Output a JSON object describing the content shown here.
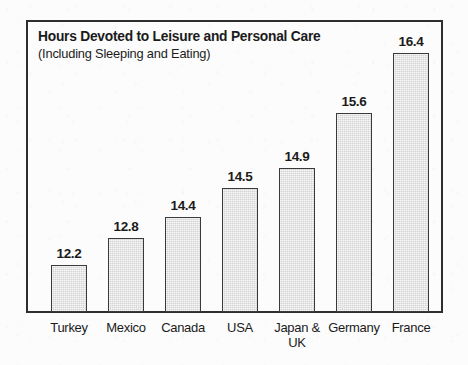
{
  "chart": {
    "title": "Hours Devoted to Leisure and Personal Care",
    "subtitle": "(Including Sleeping and Eating)"
  },
  "chart_data": {
    "type": "bar",
    "title": "Hours Devoted to Leisure and Personal Care",
    "subtitle": "(Including Sleeping and Eating)",
    "xlabel": "",
    "ylabel": "",
    "ylim": [
      0,
      17.6
    ],
    "grid": false,
    "legend": false,
    "value_labels": true,
    "bar_fill_color": "#d4d4d4",
    "bar_border_color": "#3a3a3a",
    "frame_color": "#2e2e2e",
    "background_color": "#fcfcfc",
    "categories": [
      "Turkey",
      "Mexico",
      "Canada",
      "USA",
      "Japan & UK",
      "Germany",
      "France"
    ],
    "category_lines": [
      [
        "Turkey"
      ],
      [
        "Mexico"
      ],
      [
        "Canada"
      ],
      [
        "USA"
      ],
      [
        "Japan &",
        "UK"
      ],
      [
        "Germany"
      ],
      [
        "France"
      ]
    ],
    "values": [
      12.2,
      12.8,
      14.4,
      14.5,
      14.9,
      15.6,
      16.4
    ],
    "value_labels_text": [
      "12.2",
      "12.8",
      "14.4",
      "14.5",
      "14.9",
      "15.6",
      "16.4"
    ],
    "series": [
      {
        "name": "Hours per day",
        "values": [
          12.2,
          12.8,
          14.4,
          14.5,
          14.9,
          15.6,
          16.4
        ]
      }
    ],
    "units": "hours per day"
  },
  "bars": [
    {
      "label": "Turkey",
      "line2": "",
      "value": "12.2",
      "x": 51,
      "width": 36,
      "top": 265
    },
    {
      "label": "Mexico",
      "line2": "",
      "value": "12.8",
      "x": 108,
      "width": 36,
      "top": 238
    },
    {
      "label": "Canada",
      "line2": "",
      "value": "14.4",
      "x": 165,
      "width": 36,
      "top": 217
    },
    {
      "label": "USA",
      "line2": "",
      "value": "14.5",
      "x": 222,
      "width": 36,
      "top": 188
    },
    {
      "label": "Japan &",
      "line2": "UK",
      "value": "14.9",
      "x": 279,
      "width": 36,
      "top": 168
    },
    {
      "label": "Germany",
      "line2": "",
      "value": "15.6",
      "x": 336,
      "width": 36,
      "top": 113
    },
    {
      "label": "France",
      "line2": "",
      "value": "16.4",
      "x": 393,
      "width": 36,
      "top": 53
    }
  ]
}
